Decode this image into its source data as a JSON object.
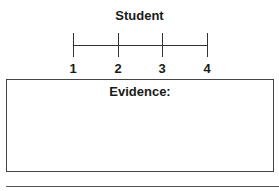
{
  "scale": {
    "title": "Student",
    "ticks": [
      {
        "label": "1"
      },
      {
        "label": "2"
      },
      {
        "label": "3"
      },
      {
        "label": "4"
      }
    ]
  },
  "evidence_box": {
    "label": "Evidence:",
    "content": ""
  }
}
